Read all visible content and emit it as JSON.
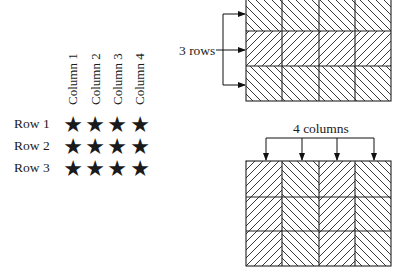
{
  "star_array": {
    "column_labels": [
      "Column 1",
      "Column 2",
      "Column 3",
      "Column 4"
    ],
    "row_labels": [
      "Row 1",
      "Row 2",
      "Row 3"
    ],
    "symbol": "★",
    "rows": 3,
    "columns": 4
  },
  "rows_diagram": {
    "label": "3 rows",
    "rows": 3,
    "columns": 4,
    "row_hatch": [
      "\\",
      "/",
      "\\"
    ]
  },
  "columns_diagram": {
    "label": "4 columns",
    "rows": 3,
    "columns": 4,
    "column_hatch": [
      "/",
      "\\",
      "/",
      "\\"
    ]
  }
}
